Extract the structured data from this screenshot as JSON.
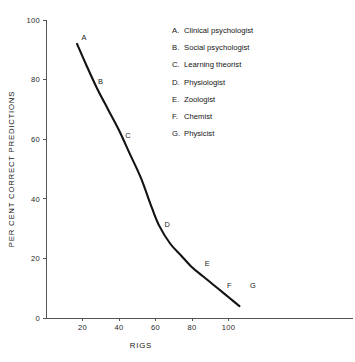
{
  "chart_data": {
    "type": "line",
    "title": "",
    "xlabel": "RIGS",
    "ylabel": "PER CENT CORRECT PREDICTIONS",
    "xlim": [
      0,
      120
    ],
    "ylim": [
      0,
      100
    ],
    "grid": false,
    "legend_position": "inside-top-right",
    "xticks": [
      20,
      40,
      60,
      80,
      100
    ],
    "yticks": [
      0,
      20,
      40,
      60,
      80,
      100
    ],
    "xtick_labels": [
      "20",
      "40",
      "60",
      "80",
      "100"
    ],
    "ytick_labels": [
      "0",
      "20",
      "40",
      "60",
      "80",
      "100"
    ],
    "curve": {
      "x": [
        17,
        22,
        28,
        34,
        40,
        46,
        52,
        58,
        62,
        68,
        74,
        80,
        86,
        92,
        98,
        102,
        106
      ],
      "y": [
        92,
        85,
        77,
        70,
        63,
        55,
        47,
        37,
        31,
        25,
        21,
        17,
        14,
        11,
        8,
        6,
        4
      ]
    },
    "points": [
      {
        "letter": "A",
        "x": 17,
        "y": 92,
        "label_dx": 7,
        "label_dy": -4
      },
      {
        "letter": "B",
        "x": 26,
        "y": 79,
        "label_dx": 7,
        "label_dy": 1
      },
      {
        "letter": "C",
        "x": 41,
        "y": 61,
        "label_dx": 7,
        "label_dy": 2
      },
      {
        "letter": "D",
        "x": 62,
        "y": 31,
        "label_dx": 8,
        "label_dy": 1
      },
      {
        "letter": "E",
        "x": 84,
        "y": 17,
        "label_dx": 8,
        "label_dy": -1
      },
      {
        "letter": "F",
        "x": 96,
        "y": 10,
        "label_dx": 8,
        "label_dy": 0
      },
      {
        "letter": "G",
        "x": 109,
        "y": 10,
        "label_dx": 8,
        "label_dy": 0
      }
    ],
    "legend": [
      {
        "letter": "A.",
        "label": "Clinical psychologist"
      },
      {
        "letter": "B.",
        "label": "Social psychologist"
      },
      {
        "letter": "C.",
        "label": "Learning theorist"
      },
      {
        "letter": "D.",
        "label": "Physiologist"
      },
      {
        "letter": "E.",
        "label": "Zoologist"
      },
      {
        "letter": "F.",
        "label": "Chemist"
      },
      {
        "letter": "G.",
        "label": "Physicist"
      }
    ],
    "colors": {
      "curve": "#131313",
      "axis": "#555555",
      "text": "#1a1a1a",
      "background": "#ffffff"
    }
  }
}
